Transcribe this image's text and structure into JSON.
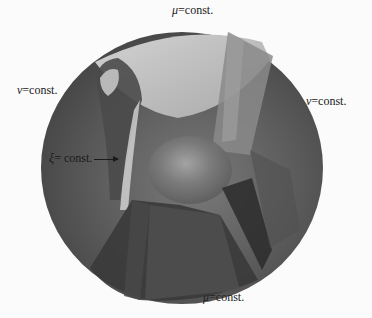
{
  "diagram": {
    "type": "coordinate-surfaces-3d",
    "labels": {
      "mu_top": {
        "symbol": "μ",
        "text": "=const."
      },
      "nu_left": {
        "symbol": "ν",
        "text": "=const."
      },
      "nu_right": {
        "symbol": "ν",
        "text": "=const."
      },
      "xi": {
        "symbol": "ξ",
        "text": "= const."
      },
      "mu_bottom": {
        "symbol": "μ",
        "text": "=const."
      }
    },
    "colors": {
      "background": "#fbfbfb",
      "sphere_dark": "#3f3f3f",
      "sphere_mid": "#6a6a6a",
      "surface_light": "#c8c8c8",
      "surface_dark": "#2a2a2a"
    }
  }
}
